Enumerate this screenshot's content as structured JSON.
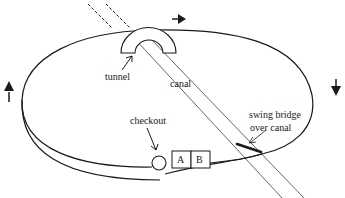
{
  "diagram": {
    "labels": {
      "tunnel": "tunnel",
      "canal": "canal",
      "checkout": "checkout",
      "swing_bridge_line1": "swing bridge",
      "swing_bridge_line2": "over canal",
      "car_a": "A",
      "car_b": "B"
    },
    "direction_arrows": [
      {
        "name": "arrow-right-icon",
        "direction": "right",
        "position": "top"
      },
      {
        "name": "arrow-down-icon",
        "direction": "down",
        "position": "right"
      },
      {
        "name": "arrow-up-icon",
        "direction": "up",
        "position": "left"
      }
    ],
    "colors": {
      "stroke": "#1a1a1a",
      "canal_stroke": "#555555",
      "background": "#ffffff"
    }
  }
}
